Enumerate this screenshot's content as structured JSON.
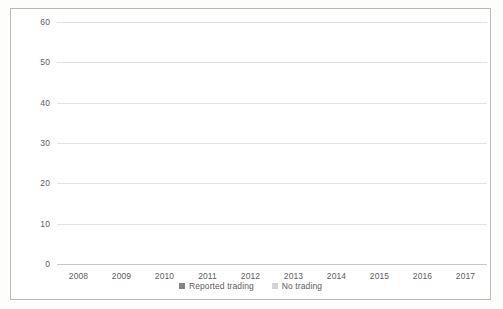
{
  "chart_data": {
    "type": "bar",
    "stacked": true,
    "title": "",
    "subtitle": "",
    "xlabel": "",
    "ylabel": "",
    "categories": [
      "2008",
      "2009",
      "2010",
      "2011",
      "2012",
      "2013",
      "2014",
      "2015",
      "2016",
      "2017"
    ],
    "series": [
      {
        "name": "Reported trading",
        "color": "#848484",
        "values": [
          8,
          5,
          6,
          6,
          8,
          19,
          21,
          33,
          36,
          35
        ]
      },
      {
        "name": "No trading",
        "color": "#d3d3d3",
        "values": [
          0.5,
          7,
          13,
          14,
          11.5,
          8,
          18,
          16,
          13,
          18
        ]
      }
    ],
    "totals": [
      8.5,
      12,
      19,
      20,
      19.5,
      27,
      39,
      49,
      49,
      53
    ],
    "ylim": [
      0,
      60
    ],
    "y_ticks": [
      0,
      10,
      20,
      30,
      40,
      50,
      60
    ],
    "y_tick_labels": [
      "0",
      "10",
      "20",
      "30",
      "40",
      "50",
      "60"
    ],
    "grid": true,
    "legend_position": "bottom"
  },
  "legend": {
    "items": [
      {
        "label": "Reported trading",
        "swatch": "#848484"
      },
      {
        "label": "No trading",
        "swatch": "#d3d3d3"
      }
    ]
  }
}
